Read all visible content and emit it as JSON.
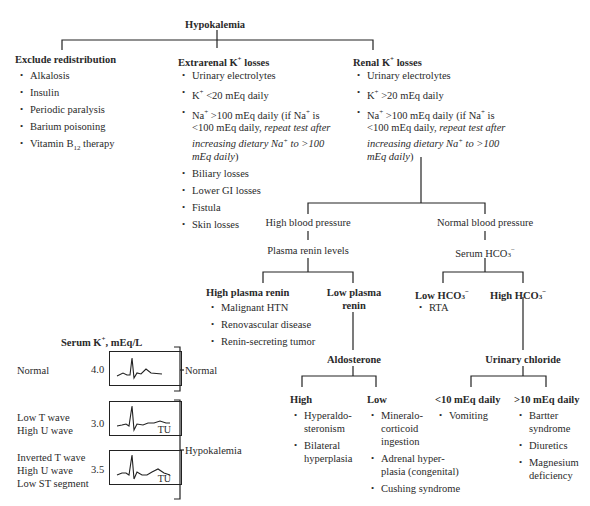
{
  "root": {
    "title": "Hypokalemia"
  },
  "branches": {
    "redistribution": {
      "title": "Exclude redistribution",
      "items": [
        "Alkalosis",
        "Insulin",
        "Periodic paralysis",
        "Barium poisoning",
        "Vitamin B12 therapy"
      ]
    },
    "extrarenal": {
      "title": "Extrarenal K+ losses",
      "items": [
        "Urinary electrolytes",
        "K+ <20 mEq daily",
        "Na+ >100 mEq daily (if Na+ is <100 mEq daily, repeat test after increasing dietary Na+ to >100 mEq daily)",
        "Biliary losses",
        "Lower GI losses",
        "Fistula",
        "Skin losses"
      ]
    },
    "renal": {
      "title": "Renal K+ losses",
      "items": [
        "Urinary electrolytes",
        "K+ >20 mEq daily",
        "Na+ >100 mEq daily (if Na+ is <100 mEq daily, repeat test after increasing dietary Na+ to >100 mEq daily)"
      ]
    }
  },
  "renal_tree": {
    "high_bp": {
      "label": "High blood pressure",
      "next": "Plasma renin levels",
      "high_renin": {
        "title": "High plasma renin",
        "items": [
          "Malignant HTN",
          "Renovascular disease",
          "Renin-secreting tumor"
        ]
      },
      "low_renin": {
        "title": "Low plasma renin",
        "next": "Aldosterone",
        "high": {
          "title": "High",
          "items": [
            "Hyperaldosteronism",
            "Bilateral hyperplasia"
          ]
        },
        "low": {
          "title": "Low",
          "items": [
            "Mineralocorticoid ingestion",
            "Adrenal hyperplasia (congenital)",
            "Cushing syndrome"
          ]
        }
      }
    },
    "normal_bp": {
      "label": "Normal blood pressure",
      "next": "Serum HCO3−",
      "low_hco3": {
        "title": "Low HCO3−",
        "items": [
          "RTA"
        ]
      },
      "high_hco3": {
        "title": "High HCO3−",
        "next": "Urinary chloride",
        "lt10": {
          "title": "<10 mEq daily",
          "items": [
            "Vomiting"
          ]
        },
        "gt10": {
          "title": ">10 mEq daily",
          "items": [
            "Bartter syndrome",
            "Diuretics",
            "Magnesium deficiency"
          ]
        }
      }
    }
  },
  "ecg_panel": {
    "title": "Serum K+, mEq/L",
    "rows": [
      {
        "desc": [
          "Normal"
        ],
        "value": "4.0",
        "label_tu": ""
      },
      {
        "desc": [
          "Low T wave",
          "High U wave"
        ],
        "value": "3.0",
        "label_tu": "TU"
      },
      {
        "desc": [
          "Inverted T wave",
          "High U wave",
          "Low ST segment"
        ],
        "value": "3.5",
        "label_tu": "TU"
      }
    ],
    "groups": [
      {
        "label": "Normal"
      },
      {
        "label": "Hypokalemia"
      }
    ]
  }
}
